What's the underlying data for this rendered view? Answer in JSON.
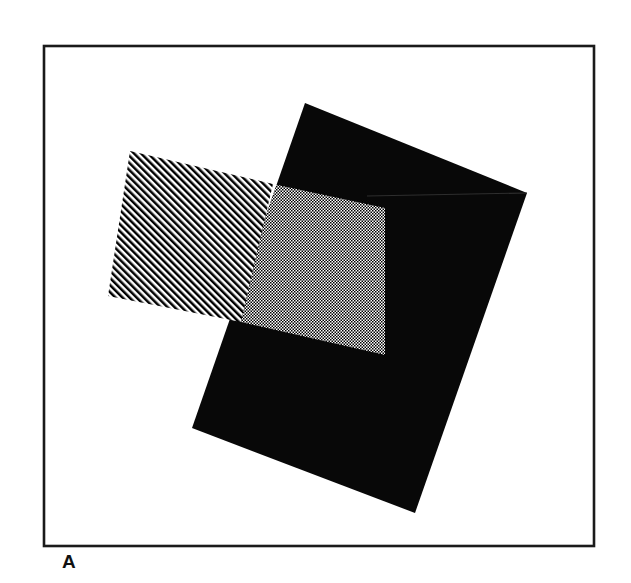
{
  "figure": {
    "panel_label": "A",
    "caption_visible": "A",
    "background_color": "#ffffff",
    "ink_color": "#000000",
    "frame": {
      "name": "figure-border",
      "x": 44,
      "y": 46,
      "width": 550,
      "height": 500,
      "stroke_color": "#1a1a1a",
      "stroke_width": 2.6,
      "fill": "none"
    },
    "shapes": [
      {
        "id": "black-quad",
        "label": "solid black rotated square",
        "fill_style": "solid",
        "fill_color": "#080808",
        "points": [
          [
            305,
            103
          ],
          [
            527,
            193
          ],
          [
            415,
            513
          ],
          [
            192,
            428
          ]
        ]
      },
      {
        "id": "hatched-quad",
        "label": "diagonal hatched rotated rectangle",
        "fill_style": "diagonal-stripes",
        "fill_color": "#000000",
        "stripe_angle_deg": 45,
        "stripe_period_px": 5.0,
        "stripe_width_px": 2.5,
        "points": [
          [
            130,
            151
          ],
          [
            273,
            184
          ],
          [
            241,
            322
          ],
          [
            108,
            296
          ]
        ]
      },
      {
        "id": "overlap-dotted",
        "label": "checkerboard dotted intersection region",
        "fill_style": "checker-dots",
        "fill_color": "#000000",
        "dot_period_px": 3.0,
        "dot_size_px": 1.5,
        "points": [
          [
            273,
            184
          ],
          [
            367,
            206
          ],
          [
            365,
            262
          ],
          [
            347,
            338
          ],
          [
            241,
            322
          ]
        ]
      }
    ]
  }
}
